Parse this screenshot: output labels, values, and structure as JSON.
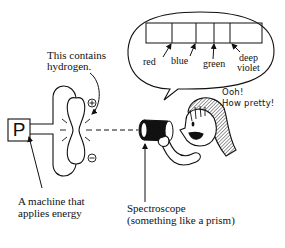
{
  "diagram": {
    "hydrogen_label": {
      "line1": "This contains",
      "line2": "hydrogen."
    },
    "machine": {
      "symbol": "P",
      "label_line1": "A machine that",
      "label_line2": "applies energy"
    },
    "tube_terminals": {
      "positive": "+",
      "negative": "−"
    },
    "spectroscope": {
      "line1": "Spectroscope",
      "line2": "(something like a prism)"
    },
    "speech_bubble": {
      "spectrum_lines": [
        {
          "label": "red"
        },
        {
          "label": "blue"
        },
        {
          "label": "green"
        },
        {
          "label_line1": "deep",
          "label_line2": "violet"
        }
      ]
    },
    "exclamation": {
      "line1": "Ooh!",
      "line2": "How pretty!"
    },
    "colors": {
      "ink": "#111111",
      "background": "#ffffff",
      "hair_shade": "#9a9a9a"
    }
  }
}
